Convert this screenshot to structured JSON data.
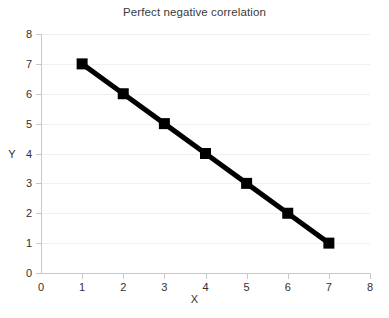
{
  "chart_data": {
    "type": "line",
    "title": "Perfect negative correlation",
    "xlabel": "X",
    "ylabel": "Y",
    "x": [
      1,
      2,
      3,
      4,
      5,
      6,
      7
    ],
    "values": [
      7,
      6,
      5,
      4,
      3,
      2,
      1
    ],
    "series": [
      {
        "name": "Perfect negative correlation",
        "x": [
          1,
          2,
          3,
          4,
          5,
          6,
          7
        ],
        "values": [
          7,
          6,
          5,
          4,
          3,
          2,
          1
        ]
      }
    ],
    "xlim": [
      0,
      8
    ],
    "ylim": [
      0,
      8
    ],
    "x_ticks": [
      "0",
      "1",
      "2",
      "3",
      "4",
      "5",
      "6",
      "7",
      "8"
    ],
    "y_ticks": [
      "0",
      "1",
      "2",
      "3",
      "4",
      "5",
      "6",
      "7",
      "8"
    ],
    "grid": "horizontal",
    "legend": "none",
    "marker": "square",
    "marker_color": "#000000",
    "line_color": "#000000",
    "gridline_color": "#f0f0f0",
    "axis_color": "#c8c8c8",
    "text_color": "#303030",
    "title_color": "#3a3a3a",
    "background": "#ffffff"
  }
}
